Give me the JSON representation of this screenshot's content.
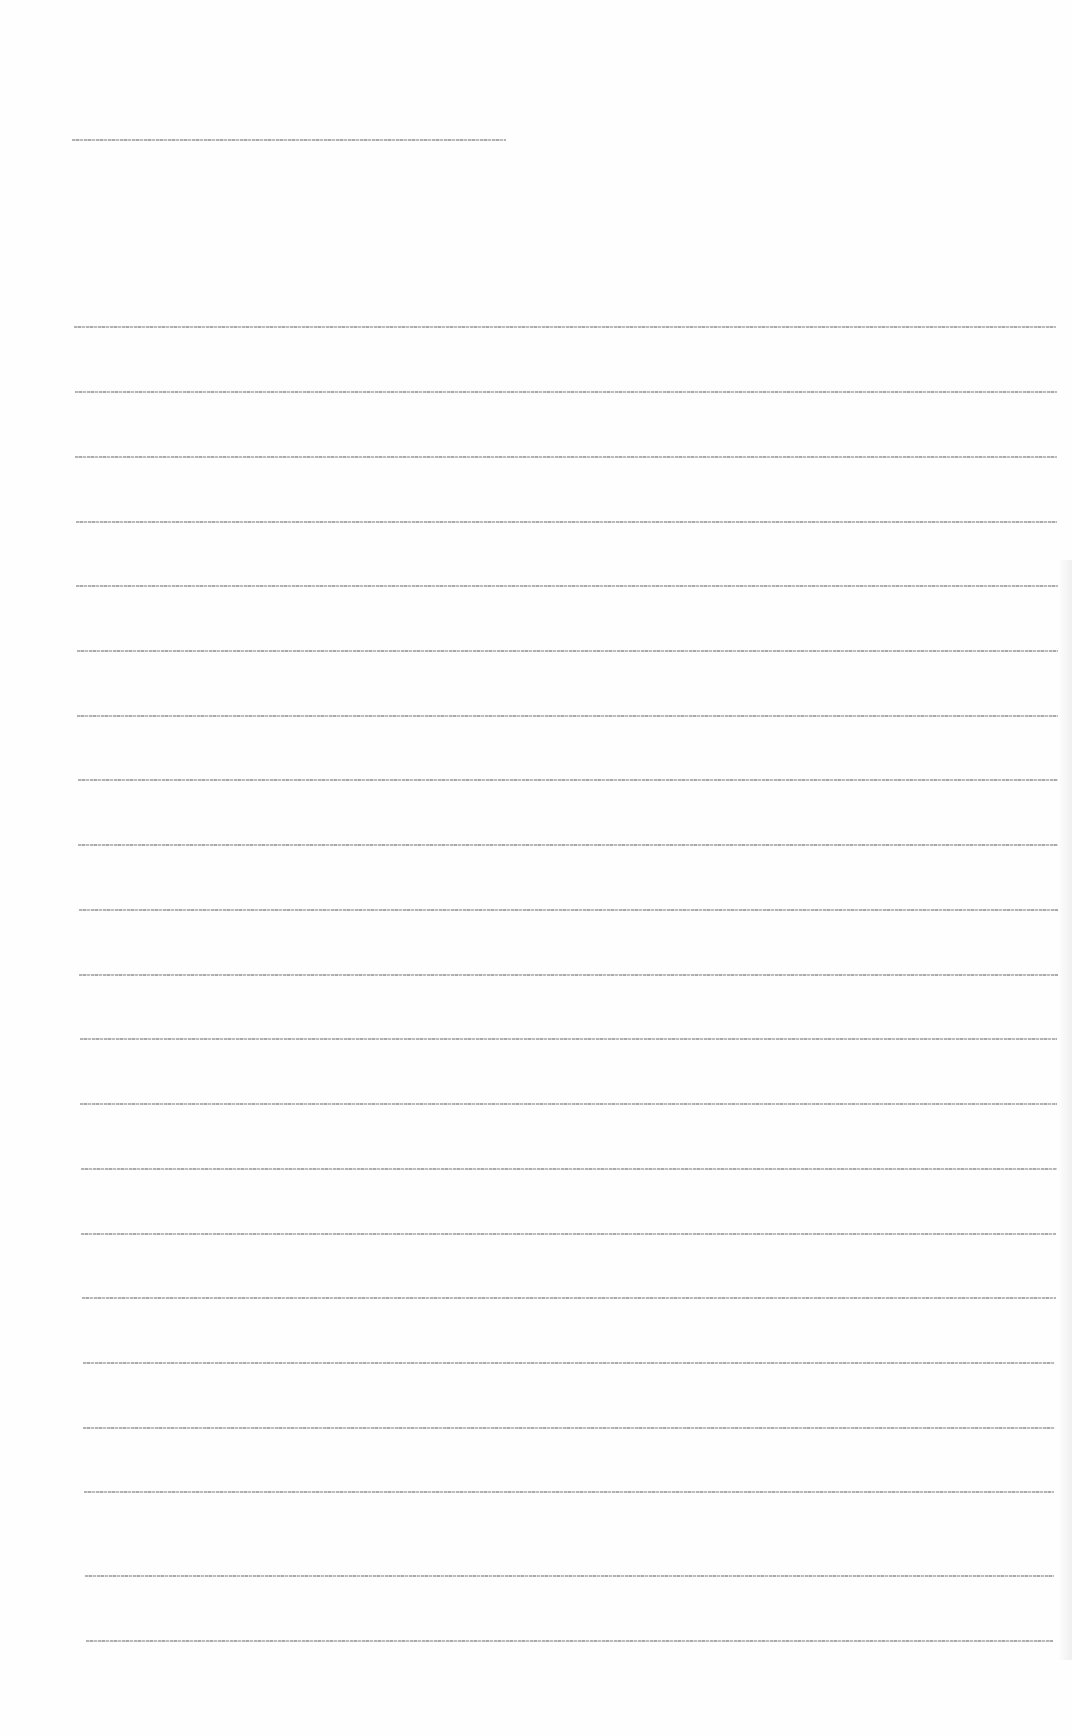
{
  "document": {
    "type": "scanned page, text illegible at this resolution",
    "header_line": {
      "text": "[illegible]"
    },
    "body_lines": [
      {
        "text": "[illegible]",
        "top": 326,
        "left": 74,
        "right": 1056
      },
      {
        "text": "[illegible]",
        "top": 391,
        "left": 75,
        "right": 1057
      },
      {
        "text": "[illegible]",
        "top": 456,
        "left": 75,
        "right": 1057
      },
      {
        "text": "[illegible]",
        "top": 521,
        "left": 76,
        "right": 1057
      },
      {
        "text": "[illegible]",
        "top": 585,
        "left": 76,
        "right": 1058
      },
      {
        "text": "[illegible]",
        "top": 650,
        "left": 77,
        "right": 1058
      },
      {
        "text": "[illegible]",
        "top": 715,
        "left": 77,
        "right": 1058
      },
      {
        "text": "[illegible]",
        "top": 779,
        "left": 78,
        "right": 1058
      },
      {
        "text": "[illegible]",
        "top": 844,
        "left": 78,
        "right": 1058
      },
      {
        "text": "[illegible]",
        "top": 909,
        "left": 79,
        "right": 1058
      },
      {
        "text": "[illegible]",
        "top": 974,
        "left": 79,
        "right": 1058
      },
      {
        "text": "[illegible]",
        "top": 1038,
        "left": 80,
        "right": 1057
      },
      {
        "text": "[illegible]",
        "top": 1103,
        "left": 80,
        "right": 1057
      },
      {
        "text": "[illegible]",
        "top": 1168,
        "left": 81,
        "right": 1057
      },
      {
        "text": "[illegible]",
        "top": 1233,
        "left": 81,
        "right": 1056
      },
      {
        "text": "[illegible]",
        "top": 1297,
        "left": 82,
        "right": 1056
      },
      {
        "text": "[illegible]",
        "top": 1362,
        "left": 83,
        "right": 1055
      },
      {
        "text": "[illegible]",
        "top": 1427,
        "left": 83,
        "right": 1055
      },
      {
        "text": "[illegible]",
        "top": 1491,
        "left": 84,
        "right": 1054
      },
      {
        "text": "[illegible]",
        "top": 1575,
        "left": 85,
        "right": 1054
      },
      {
        "text": "[illegible]",
        "top": 1640,
        "left": 86,
        "right": 1053
      }
    ]
  }
}
